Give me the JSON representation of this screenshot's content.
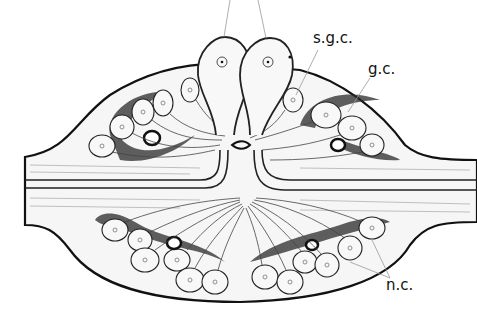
{
  "figure": {
    "type": "anatomical illustration",
    "labels": [
      {
        "id": "sgc",
        "text": "s.g.c."
      },
      {
        "id": "gc",
        "text": "g.c."
      },
      {
        "id": "nc",
        "text": "n.c."
      }
    ]
  }
}
